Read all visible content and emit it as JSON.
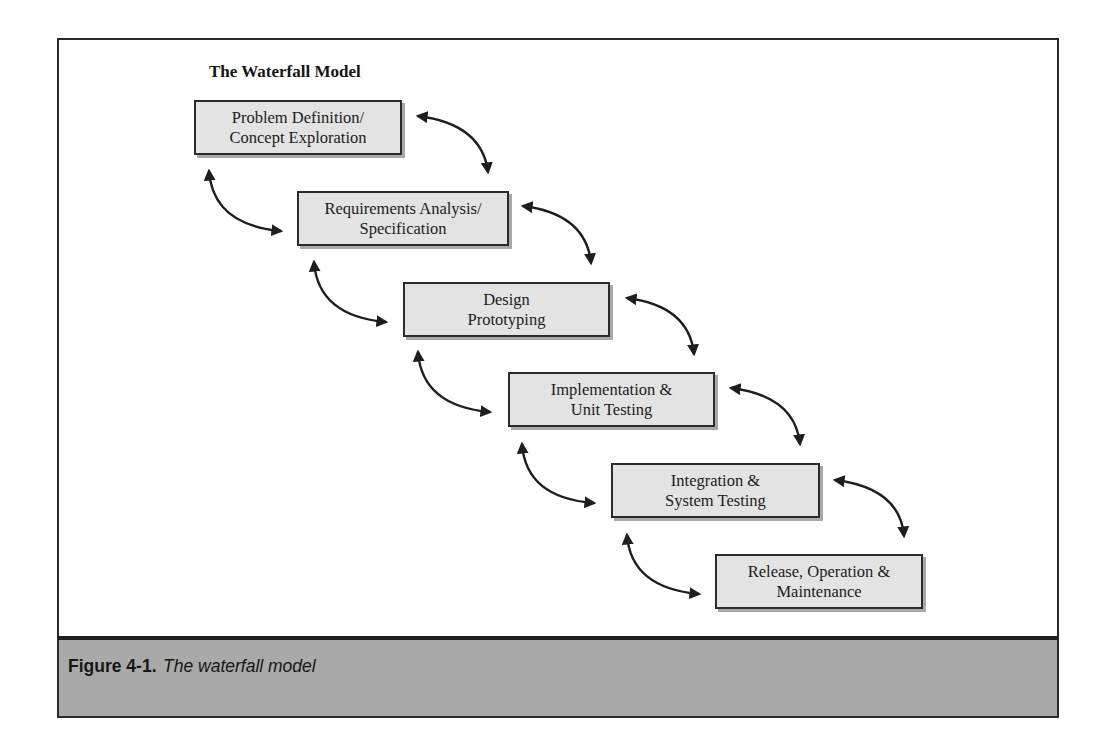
{
  "diagram": {
    "title": "The Waterfall Model",
    "stages": [
      {
        "line1": "Problem Definition/",
        "line2": "Concept Exploration"
      },
      {
        "line1": "Requirements Analysis/",
        "line2": "Specification"
      },
      {
        "line1": "Design",
        "line2": "Prototyping"
      },
      {
        "line1": "Implementation &",
        "line2": "Unit Testing"
      },
      {
        "line1": "Integration &",
        "line2": "System Testing"
      },
      {
        "line1": "Release, Operation &",
        "line2": "Maintenance"
      }
    ],
    "arrows": {
      "forward": "double-headed curved arrow from each stage to the next (right side)",
      "backward": "double-headed curved arrow from each stage back to the previous (left side)"
    }
  },
  "caption": {
    "number": "Figure 4-1.",
    "text": "The waterfall model"
  },
  "colors": {
    "box_fill": "#e3e3e3",
    "box_border": "#2b2b2b",
    "caption_band": "#a9a9a9",
    "arrow": "#1e1e1e"
  }
}
